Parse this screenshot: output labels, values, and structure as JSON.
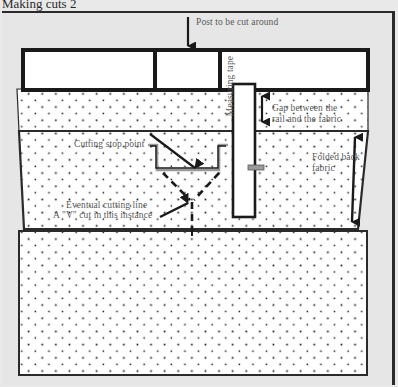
{
  "figure": {
    "caption": "Making cuts 2",
    "labels": {
      "post": "Post to be cut around",
      "gap": "Gap between the rail and the fabric",
      "folded": "Folded back fabric",
      "measuring_tape": "Measuring tape",
      "cutting_stop_point": "Cutting stop point",
      "eventual_cutting_line": "Eventual cutting line",
      "v_cut": "A \"V\" cut in this instance"
    },
    "colors": {
      "page_background": "#e9e9e9",
      "fabric_fill": "#ffffff",
      "dot_color": "#1a1a1a",
      "ink": "#2a2a2a",
      "label_text": "#5a5a5a",
      "tape_fill": "#ffffff",
      "tape_marker": "#9a9a9a"
    },
    "elements": {
      "rail_segments": 3,
      "post_arrow": "down-arrow",
      "gap_arrow": "double-headed-vertical-arrow",
      "folded_arrow": "double-headed-vertical-arrow",
      "cut_shape": "T-shaped cut",
      "v_cut_style": "dashed"
    }
  }
}
